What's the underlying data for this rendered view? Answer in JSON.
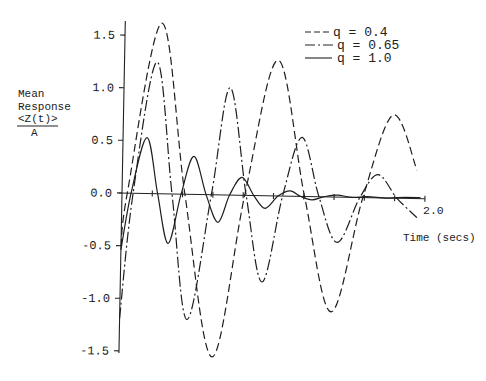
{
  "chart_data": {
    "type": "line",
    "title": "",
    "xlabel": "Time (secs)",
    "ylabel": "Mean Response <Z(t)>/A",
    "ylabel_lines": [
      "Mean",
      "Response",
      "<Z(t)>",
      "A"
    ],
    "xlim": [
      0,
      2.0
    ],
    "ylim": [
      -1.5,
      1.5
    ],
    "x_ticks": [
      0.2,
      0.4,
      0.6,
      0.8,
      1.0,
      1.2,
      1.4,
      1.6,
      1.8,
      2.0
    ],
    "x_tick_label_end": "2.0",
    "y_ticks": [
      1.5,
      1.0,
      0.5,
      0.0,
      -0.5,
      -1.0,
      -1.5
    ],
    "y_tick_labels": [
      "1.5",
      "1.0",
      "0.5",
      "0.0",
      "-0.5",
      "-1.0",
      "-1.5"
    ],
    "grid": false,
    "legend_position": "upper right",
    "series": [
      {
        "name": "q = 0.4",
        "style": "dashed",
        "x": [
          0,
          0.035,
          0.242,
          0.415,
          0.615,
          0.81,
          1.013,
          1.205,
          1.395,
          1.59,
          1.779,
          1.944
        ],
        "y": [
          -0.51,
          0,
          1.62,
          0,
          -1.54,
          0,
          1.29,
          0,
          -1.09,
          0,
          0.79,
          0.27
        ]
      },
      {
        "name": "q = 0.65",
        "style": "dashdot",
        "x": [
          0,
          0.073,
          0.215,
          0.33,
          0.445,
          0.59,
          0.7,
          0.82,
          0.935,
          1.06,
          1.181,
          1.3,
          1.426,
          1.57,
          1.688,
          1.815,
          1.95
        ],
        "y": [
          -1.19,
          0,
          1.25,
          0,
          -1.19,
          0,
          1.02,
          0,
          -0.82,
          0,
          0.56,
          0,
          -0.43,
          0,
          0.22,
          0,
          -0.18
        ]
      },
      {
        "name": "q = 1.0",
        "style": "solid",
        "x": [
          0,
          0.06,
          0.158,
          0.235,
          0.31,
          0.39,
          0.47,
          0.555,
          0.637,
          0.71,
          0.79,
          0.87,
          0.946,
          1.03,
          1.109,
          1.18,
          1.254,
          1.33,
          1.42,
          1.52,
          1.62,
          1.75,
          1.87,
          1.97
        ],
        "y": [
          -0.54,
          0,
          0.53,
          0,
          -0.47,
          0,
          0.36,
          0,
          -0.26,
          0,
          0.17,
          0,
          -0.12,
          0,
          0.05,
          0,
          -0.03,
          0,
          0.02,
          0,
          0.01,
          0,
          0.01,
          0.01
        ]
      }
    ]
  }
}
